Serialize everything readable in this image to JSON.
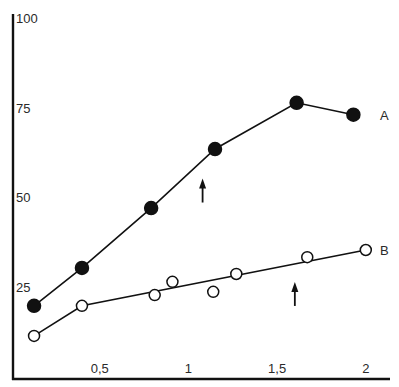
{
  "chart_data": {
    "type": "line",
    "title": "",
    "xlabel": "",
    "ylabel": "",
    "xlim": [
      0,
      2.15
    ],
    "ylim": [
      0,
      100
    ],
    "x_ticks": [
      {
        "value": 0.5,
        "label": "0,5"
      },
      {
        "value": 1,
        "label": "1"
      },
      {
        "value": 1.5,
        "label": "1,5"
      },
      {
        "value": 2,
        "label": "2"
      }
    ],
    "y_ticks": [
      {
        "value": 25,
        "label": "25"
      },
      {
        "value": 50,
        "label": "50"
      },
      {
        "value": 75,
        "label": "75"
      },
      {
        "value": 100,
        "label": "100"
      }
    ],
    "grid": false,
    "legend": "inline labels at right end of each series",
    "series": [
      {
        "name": "A",
        "marker": "filled-circle",
        "connected": true,
        "points": [
          {
            "x": 0.13,
            "y": 19.6
          },
          {
            "x": 0.4,
            "y": 30.2
          },
          {
            "x": 0.79,
            "y": 46.9
          },
          {
            "x": 1.15,
            "y": 63.4
          },
          {
            "x": 1.61,
            "y": 76.3
          },
          {
            "x": 1.93,
            "y": 73.0
          }
        ],
        "arrow_at_x": 1.08
      },
      {
        "name": "B",
        "marker": "open-circle",
        "connected_line": [
          {
            "x": 0.13,
            "y": 11.2
          },
          {
            "x": 0.4,
            "y": 19.6
          },
          {
            "x": 2.0,
            "y": 35.2
          }
        ],
        "points": [
          {
            "x": 0.13,
            "y": 11.2
          },
          {
            "x": 0.4,
            "y": 19.6
          },
          {
            "x": 0.81,
            "y": 22.6
          },
          {
            "x": 0.91,
            "y": 26.3
          },
          {
            "x": 1.14,
            "y": 23.5
          },
          {
            "x": 1.27,
            "y": 28.5
          },
          {
            "x": 1.67,
            "y": 33.2
          },
          {
            "x": 2.0,
            "y": 35.2
          }
        ],
        "arrow_at_x": 1.6
      }
    ]
  }
}
